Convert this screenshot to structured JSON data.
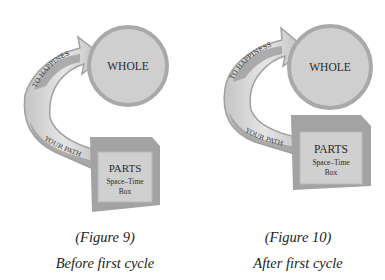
{
  "figures": [
    {
      "id": "figure-9",
      "whole_label": "WHOLE",
      "arrow_top_label": "TO HAPPINES",
      "arrow_bottom_label": "YOUR PATH",
      "box_title": "PARTS",
      "box_line1": "Space–Time",
      "box_line2": "Box",
      "caption_number": "(Figure 9)",
      "caption_text": "Before first cycle"
    },
    {
      "id": "figure-10",
      "whole_label": "WHOLE",
      "arrow_top_label": "TO HAPPINESS",
      "arrow_bottom_label": "YOUR PATH",
      "box_title": "PARTS",
      "box_line1": "Space–Time",
      "box_line2": "Box",
      "caption_number": "(Figure 10)",
      "caption_text": "After first cycle"
    }
  ],
  "colors": {
    "circle_fill": "#cfcfcf",
    "circle_border": "#a9a9a9",
    "arrow_light": "#d9d9d9",
    "arrow_dark": "#9a9a9a",
    "box_front": "#d0d0d0",
    "box_frame": "#a3a3a3",
    "text": "#2a2a2a"
  }
}
